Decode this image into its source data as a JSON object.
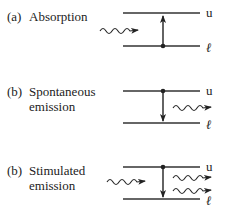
{
  "panels": [
    {
      "tag": "(a)",
      "title_line1": "Absorption",
      "title_line2": ""
    },
    {
      "tag": "(b)",
      "title_line1": "Spontaneous",
      "title_line2": "emission"
    },
    {
      "tag": "(b)",
      "title_line1": "Stimulated",
      "title_line2": "emission"
    }
  ],
  "levels": {
    "upper": "u",
    "lower": "ℓ"
  }
}
